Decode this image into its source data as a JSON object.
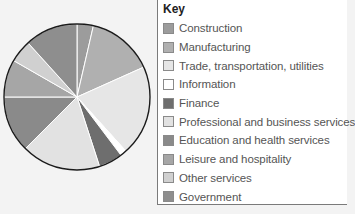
{
  "chart_data": {
    "type": "pie",
    "title": "",
    "legend_title": "Key",
    "legend_position": "right",
    "start_angle_deg": 0,
    "direction": "clockwise",
    "categories": [
      "Construction",
      "Manufacturing",
      "Trade, transportation, utilities",
      "Information",
      "Finance",
      "Professional and business services",
      "Education and health services",
      "Leisure and hospitality",
      "Other services",
      "Government"
    ],
    "values": [
      3.6,
      14.7,
      20.0,
      1.4,
      5.3,
      17.5,
      12.5,
      8.3,
      5.0,
      11.7
    ],
    "colors": [
      "#9c9c9c",
      "#b0b0b0",
      "#e6e6e6",
      "#ffffff",
      "#6e6e6e",
      "#e2e2e2",
      "#8a8a8a",
      "#a6a6a6",
      "#d0d0d0",
      "#8e8e8e"
    ],
    "units": "percent (estimated from slice angles)"
  },
  "legend": {
    "title": "Key",
    "items": [
      {
        "label": "Construction"
      },
      {
        "label": "Manufacturing"
      },
      {
        "label": "Trade, transportation, utilities"
      },
      {
        "label": "Information"
      },
      {
        "label": "Finance"
      },
      {
        "label": "Professional and business services"
      },
      {
        "label": "Education and health services"
      },
      {
        "label": "Leisure and hospitality"
      },
      {
        "label": "Other services"
      },
      {
        "label": "Government"
      }
    ]
  }
}
